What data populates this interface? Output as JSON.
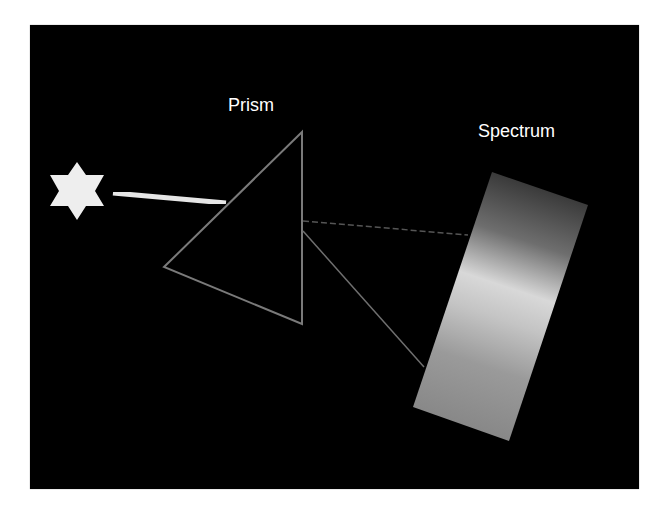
{
  "diagram": {
    "labels": {
      "prism": "Prism",
      "spectrum": "Spectrum"
    },
    "elements": {
      "light_source": {
        "shape": "six-pointed-star",
        "icon": "star-icon",
        "color": "#eeeeee",
        "center": [
          77,
          191
        ],
        "radius": 31
      },
      "incident_beam": {
        "from": [
          113,
          193
        ],
        "to": [
          226,
          203
        ],
        "color": "#e6e6e6",
        "width": 5
      },
      "prism": {
        "shape": "triangle",
        "vertices": [
          [
            302,
            132
          ],
          [
            164,
            267
          ],
          [
            302,
            324
          ]
        ],
        "stroke": "#7a7a7a"
      },
      "refracted_rays": [
        {
          "from": [
            303,
            221
          ],
          "to": [
            468,
            235
          ],
          "color": "#555555",
          "style": "dashed"
        },
        {
          "from": [
            303,
            231
          ],
          "to": [
            424,
            367
          ],
          "color": "#6f6f6f",
          "style": "solid"
        }
      ],
      "spectrum": {
        "shape": "rotated-rectangle",
        "corners": [
          [
            492,
            172
          ],
          [
            588,
            205
          ],
          [
            509,
            441
          ],
          [
            413,
            407
          ]
        ],
        "gradient_stops": [
          {
            "offset": 0,
            "color": "#3a3a3a"
          },
          {
            "offset": 0.22,
            "color": "#6e6e6e"
          },
          {
            "offset": 0.42,
            "color": "#d8d8d8"
          },
          {
            "offset": 0.55,
            "color": "#c4c4c4"
          },
          {
            "offset": 0.75,
            "color": "#9a9a9a"
          },
          {
            "offset": 1,
            "color": "#888888"
          }
        ]
      }
    },
    "colors": {
      "background": "#000000",
      "page": "#ffffff",
      "text": "#ffffff"
    }
  }
}
